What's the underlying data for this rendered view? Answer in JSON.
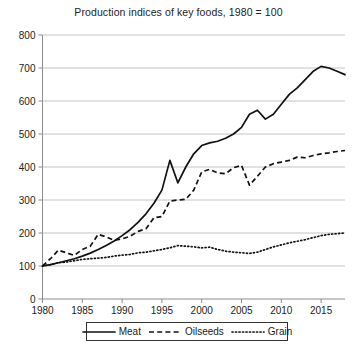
{
  "chart_data": {
    "type": "line",
    "title": "Production indices of key foods, 1980 = 100",
    "xlabel": "",
    "ylabel": "",
    "xlim": [
      1980,
      2018
    ],
    "ylim": [
      0,
      800
    ],
    "ytick_labels": [
      "0",
      "100",
      "200",
      "300",
      "400",
      "500",
      "600",
      "700",
      "800"
    ],
    "ytick_values": [
      0,
      100,
      200,
      300,
      400,
      500,
      600,
      700,
      800
    ],
    "xtick_labels": [
      "1980",
      "1985",
      "1990",
      "1995",
      "2000",
      "2005",
      "2010",
      "2015"
    ],
    "xtick_values": [
      1980,
      1985,
      1990,
      1995,
      2000,
      2005,
      2010,
      2015
    ],
    "grid": "horizontal",
    "legend_position": "bottom",
    "x": [
      1980,
      1981,
      1982,
      1983,
      1984,
      1985,
      1986,
      1987,
      1988,
      1989,
      1990,
      1991,
      1992,
      1993,
      1994,
      1995,
      1996,
      1997,
      1998,
      1999,
      2000,
      2001,
      2002,
      2003,
      2004,
      2005,
      2006,
      2007,
      2008,
      2009,
      2010,
      2011,
      2012,
      2013,
      2014,
      2015,
      2016,
      2017,
      2018
    ],
    "series": [
      {
        "name": "Meat",
        "style": "solid",
        "values": [
          100,
          104,
          110,
          116,
          122,
          130,
          139,
          150,
          162,
          176,
          192,
          210,
          232,
          258,
          290,
          330,
          420,
          352,
          400,
          440,
          465,
          473,
          478,
          487,
          500,
          520,
          560,
          572,
          545,
          560,
          590,
          620,
          640,
          665,
          690,
          705,
          700,
          690,
          680
        ]
      },
      {
        "name": "Oilseeds",
        "style": "dashed",
        "values": [
          100,
          122,
          148,
          140,
          132,
          150,
          160,
          196,
          188,
          178,
          182,
          190,
          205,
          213,
          246,
          250,
          297,
          300,
          302,
          330,
          385,
          393,
          382,
          380,
          398,
          405,
          345,
          372,
          400,
          410,
          415,
          420,
          430,
          428,
          435,
          440,
          443,
          447,
          450
        ]
      },
      {
        "name": "Grain",
        "style": "dotted",
        "values": [
          100,
          104,
          110,
          112,
          116,
          120,
          122,
          124,
          126,
          130,
          133,
          135,
          140,
          142,
          146,
          150,
          155,
          162,
          160,
          158,
          155,
          157,
          150,
          145,
          142,
          140,
          138,
          142,
          150,
          158,
          164,
          170,
          175,
          180,
          186,
          192,
          196,
          198,
          200
        ]
      }
    ]
  },
  "legend": {
    "items": [
      {
        "label": "Meat",
        "style": "solid"
      },
      {
        "label": "Oilseeds",
        "style": "dashed"
      },
      {
        "label": "Grain",
        "style": "dotted"
      }
    ]
  }
}
